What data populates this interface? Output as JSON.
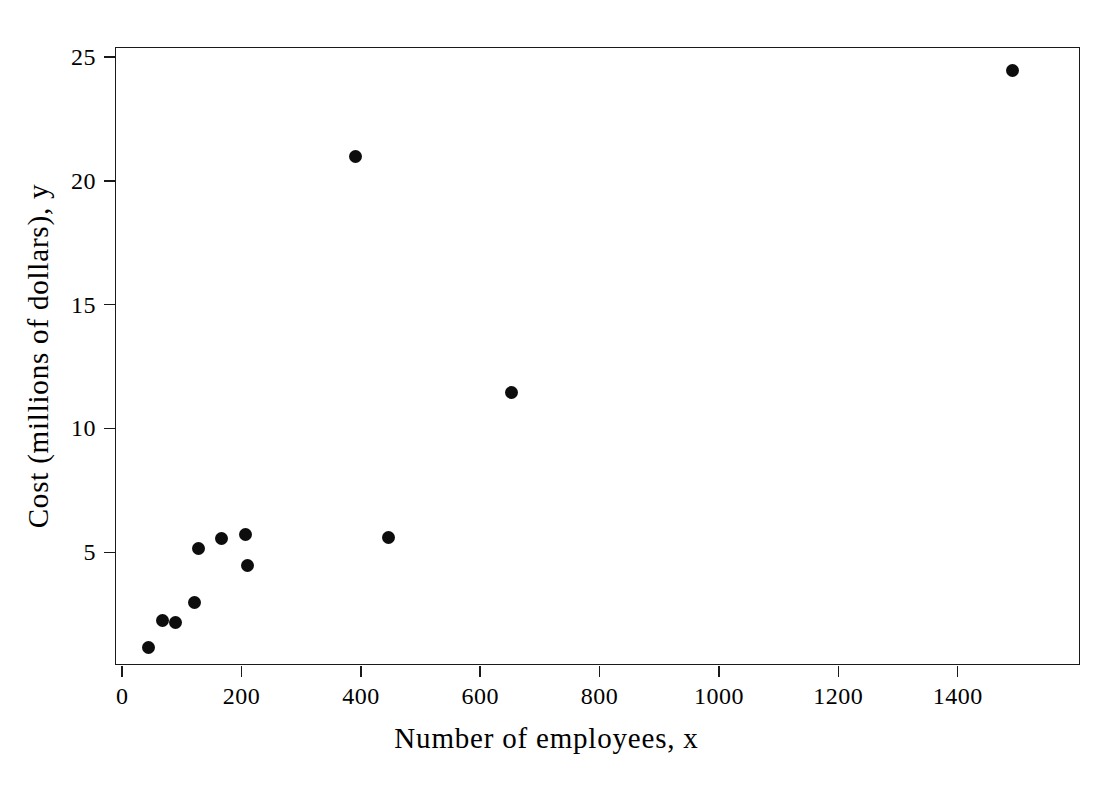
{
  "chart_data": {
    "type": "scatter",
    "title": "",
    "xlabel": "Number of employees, x",
    "ylabel": "Cost (millions of dollars), y",
    "xlim": [
      -12,
      1605
    ],
    "ylim": [
      0.45,
      25.4
    ],
    "grid": false,
    "legend": null,
    "xticks": [
      0,
      200,
      400,
      600,
      800,
      1000,
      1200,
      1400
    ],
    "xticklabels": [
      "0",
      "200",
      "400",
      "600",
      "800",
      "1000",
      "1200",
      "1400"
    ],
    "yticks": [
      5,
      10,
      15,
      20,
      25
    ],
    "yticklabels": [
      "5",
      "10",
      "15",
      "20",
      "25"
    ],
    "marker": "filled-circle",
    "marker_color": "#0d0d0d",
    "x": [
      43,
      66,
      87,
      120,
      127,
      165,
      205,
      208,
      390,
      444,
      650,
      1490
    ],
    "y": [
      1.2,
      2.3,
      2.2,
      3.0,
      5.2,
      5.6,
      5.75,
      4.5,
      21.0,
      5.65,
      11.5,
      24.5
    ],
    "points": [
      {
        "x": 43,
        "y": 1.2
      },
      {
        "x": 66,
        "y": 2.3
      },
      {
        "x": 87,
        "y": 2.2
      },
      {
        "x": 120,
        "y": 3.0
      },
      {
        "x": 127,
        "y": 5.2
      },
      {
        "x": 165,
        "y": 5.6
      },
      {
        "x": 205,
        "y": 5.75
      },
      {
        "x": 208,
        "y": 4.5
      },
      {
        "x": 390,
        "y": 21.0
      },
      {
        "x": 444,
        "y": 5.65
      },
      {
        "x": 650,
        "y": 11.5
      },
      {
        "x": 1490,
        "y": 24.5
      }
    ]
  }
}
